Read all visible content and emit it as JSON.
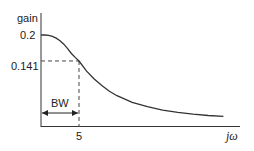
{
  "chart_data": {
    "type": "line",
    "title": "",
    "ylabel": "gain",
    "xlabel": "jω",
    "ylim": [
      0,
      0.2
    ],
    "yticks": [
      "0.2",
      "0.141"
    ],
    "ytick_values": [
      0.2,
      0.141
    ],
    "xticks": [
      "5"
    ],
    "xtick_values": [
      5
    ],
    "annotation": "BW",
    "bandwidth": 5,
    "half_power_gain": 0.141,
    "dc_gain": 0.2,
    "series": [
      {
        "name": "gain",
        "x": [
          0,
          0.5,
          1,
          1.5,
          2,
          2.5,
          3,
          3.5,
          4,
          4.5,
          5,
          6,
          7,
          8,
          9,
          10,
          12,
          14,
          16,
          18,
          20,
          22,
          24
        ],
        "values": [
          0.2,
          0.2,
          0.199,
          0.197,
          0.193,
          0.187,
          0.179,
          0.169,
          0.158,
          0.149,
          0.141,
          0.118,
          0.1,
          0.085,
          0.072,
          0.062,
          0.047,
          0.037,
          0.029,
          0.024,
          0.02,
          0.017,
          0.015
        ]
      }
    ],
    "grid": false,
    "legend": "none"
  }
}
